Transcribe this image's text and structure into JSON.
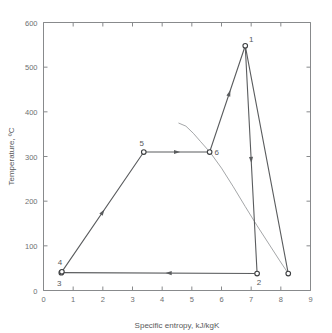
{
  "chart_data": {
    "type": "line",
    "title": "",
    "xlabel": "Specific entropy,  kJ/kgK",
    "ylabel": "Temperature, ºC",
    "xlim": [
      0,
      9
    ],
    "ylim": [
      0,
      600
    ],
    "xticks": [
      0,
      1,
      2,
      3,
      4,
      5,
      6,
      7,
      8,
      9
    ],
    "yticks": [
      0,
      100,
      200,
      300,
      400,
      500,
      600
    ],
    "xtick_labels": [
      "0",
      "1",
      "2",
      "3",
      "4",
      "5",
      "6",
      "7",
      "8",
      "9"
    ],
    "ytick_labels": [
      "0",
      "100",
      "200",
      "300",
      "400",
      "500",
      "600"
    ],
    "grid": false,
    "legend": "none",
    "series": [
      {
        "name": "Rankine reheat/regenerative cycle path",
        "kind": "cycle-path",
        "points": [
          {
            "label": "1",
            "s": 6.8,
            "T": 548,
            "label_dx": 6,
            "label_dy": -4
          },
          {
            "label": "2",
            "s": 7.2,
            "T": 38,
            "label_dx": 2,
            "label_dy": 11
          },
          {
            "label": "3",
            "s": 0.6,
            "T": 40,
            "label_dx": -2,
            "label_dy": 13
          },
          {
            "label": "4",
            "s": 0.62,
            "T": 42,
            "label_dx": -2,
            "label_dy": -7
          },
          {
            "label": "5",
            "s": 3.38,
            "T": 310,
            "label_dx": -2,
            "label_dy": -6
          },
          {
            "label": "6",
            "s": 5.6,
            "T": 310,
            "label_dx": 7,
            "label_dy": 3
          }
        ],
        "segments": [
          {
            "from": "1",
            "to": "2",
            "arrow_at": 0.5,
            "arrow_dir": "down"
          },
          {
            "from": "2",
            "to": "3",
            "arrow_at": 0.45,
            "arrow_dir": "left"
          },
          {
            "from": "3",
            "to": "5",
            "arrow_at": 0.5,
            "arrow_dir": "up-right"
          },
          {
            "from": "5",
            "to": "6",
            "arrow_at": 0.5,
            "arrow_dir": "right"
          },
          {
            "from": "6",
            "to": "1",
            "arrow_at": 0.55,
            "arrow_dir": "up-right"
          },
          {
            "from": "1",
            "to": "8.25,38",
            "arrow_at": null,
            "arrow_dir": "none"
          }
        ]
      },
      {
        "name": "Saturated vapour line",
        "kind": "dome",
        "path": [
          {
            "s": 4.55,
            "T": 375
          },
          {
            "s": 4.8,
            "T": 368
          },
          {
            "s": 5.05,
            "T": 352
          },
          {
            "s": 5.3,
            "T": 333
          },
          {
            "s": 5.62,
            "T": 309
          },
          {
            "s": 6.0,
            "T": 274
          },
          {
            "s": 6.4,
            "T": 232
          },
          {
            "s": 6.8,
            "T": 188
          },
          {
            "s": 7.2,
            "T": 145
          },
          {
            "s": 7.6,
            "T": 104
          },
          {
            "s": 7.95,
            "T": 68
          },
          {
            "s": 8.25,
            "T": 38
          }
        ]
      }
    ],
    "end_point": {
      "s": 8.25,
      "T": 38,
      "label": ""
    }
  }
}
